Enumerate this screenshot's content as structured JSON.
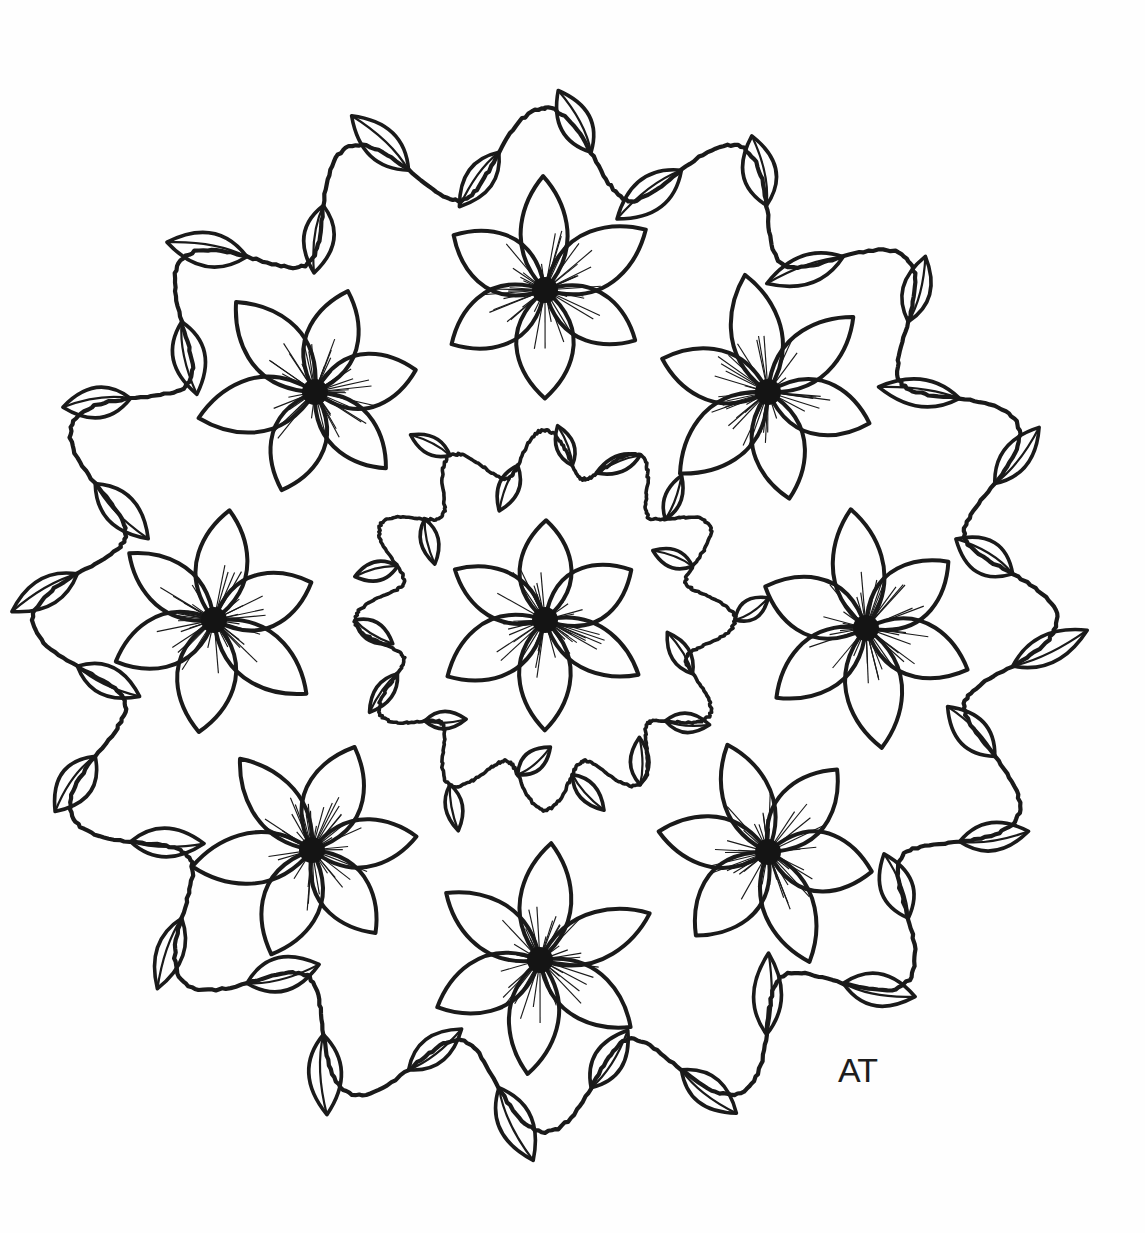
{
  "artwork": {
    "title": "Floral Mandala Coloring Page",
    "medium": "ink line drawing on white paper",
    "signature": "AT",
    "background_color": "#fefefe",
    "ink_color": "#1a1a1a",
    "canvas": {
      "width": 1145,
      "height": 1233
    },
    "center": {
      "x": 545,
      "y": 620
    },
    "composition": "radially symmetric floral mandala: a central six-petal flower ringed by a small leafy vine, surrounded by eight six-petal flowers, all enclosed by a large scalloped leafy vine border"
  },
  "elements": {
    "outer_vine": {
      "name": "outer-scalloped-vine",
      "scallop_count": 16,
      "mean_radius": 470,
      "amplitude": 42,
      "leaf_count": 32,
      "leaf_length": 74,
      "leaf_width": 30
    },
    "inner_vine": {
      "name": "inner-scalloped-vine",
      "scallop_count": 12,
      "mean_radius": 168,
      "amplitude": 22,
      "leaf_count": 18,
      "leaf_length": 44,
      "leaf_width": 18
    },
    "center_flower": {
      "name": "center-flower",
      "petal_count": 6,
      "petal_length": 108,
      "petal_width": 46,
      "core_radius": 13,
      "stamen_count": 40,
      "rotation_deg": 0
    },
    "ring_flowers": {
      "name": "ring-flower",
      "count": 8,
      "ring_radius": 318,
      "petal_count": 6,
      "petal_length": 112,
      "petal_width": 48,
      "core_radius": 13,
      "stamen_count": 40,
      "positions": [
        {
          "label": "top",
          "x": 545,
          "y": 290,
          "rotation_deg": 0
        },
        {
          "label": "top-left",
          "x": 315,
          "y": 392,
          "rotation_deg": 18
        },
        {
          "label": "top-right",
          "x": 768,
          "y": 392,
          "rotation_deg": -12
        },
        {
          "label": "left",
          "x": 214,
          "y": 620,
          "rotation_deg": 8
        },
        {
          "label": "right",
          "x": 866,
          "y": 628,
          "rotation_deg": -8
        },
        {
          "label": "bottom-left",
          "x": 312,
          "y": 850,
          "rotation_deg": 22
        },
        {
          "label": "bottom-right",
          "x": 768,
          "y": 852,
          "rotation_deg": -20
        },
        {
          "label": "bottom",
          "x": 540,
          "y": 960,
          "rotation_deg": 6
        }
      ]
    }
  }
}
